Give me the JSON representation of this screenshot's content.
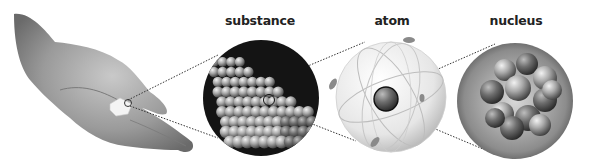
{
  "diagram": {
    "stages": [
      {
        "id": "hand",
        "label": "",
        "description": "hand holding a sugar cube"
      },
      {
        "id": "substance",
        "label": "substance",
        "description": "lattice of spherical particles"
      },
      {
        "id": "atom",
        "label": "atom",
        "description": "atom with electron orbits around a central nucleus"
      },
      {
        "id": "nucleus",
        "label": "nucleus",
        "description": "cluster of protons and neutrons"
      }
    ],
    "colors": {
      "background": "#ffffff",
      "label_text": "#222222",
      "connector": "#333333",
      "substance_bg": "#141414",
      "sphere_light": "#d8d8d8",
      "sphere_dark": "#555555"
    }
  }
}
